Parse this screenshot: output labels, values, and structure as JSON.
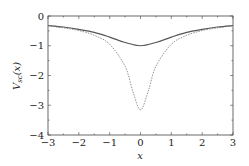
{
  "chart_data": {
    "type": "line",
    "title": "",
    "xlabel": "x",
    "ylabel": "V_sc(x)",
    "xlim": [
      -3,
      3
    ],
    "ylim": [
      -4,
      0
    ],
    "xticks": [
      -3,
      -2,
      -1,
      0,
      1,
      2,
      3
    ],
    "yticks": [
      0,
      -1,
      -2,
      -3,
      -4
    ],
    "grid": false,
    "legend": null,
    "series": [
      {
        "name": "solid",
        "style": "solid",
        "color": "#555555",
        "x": [
          -3,
          -2.5,
          -2,
          -1.5,
          -1,
          -0.5,
          0,
          0.5,
          1,
          1.5,
          2,
          2.5,
          3
        ],
        "y": [
          -0.32,
          -0.37,
          -0.45,
          -0.55,
          -0.71,
          -0.89,
          -1.0,
          -0.89,
          -0.71,
          -0.55,
          -0.45,
          -0.37,
          -0.32
        ]
      },
      {
        "name": "dashed",
        "style": "dashed",
        "color": "#777777",
        "x": [
          -3,
          -2.5,
          -2,
          -1.5,
          -1,
          -0.5,
          -0.25,
          0,
          0.25,
          0.5,
          1,
          1.5,
          2,
          2.5,
          3
        ],
        "y": [
          -0.33,
          -0.4,
          -0.49,
          -0.65,
          -0.95,
          -1.69,
          -2.53,
          -3.16,
          -2.53,
          -1.69,
          -0.95,
          -0.65,
          -0.49,
          -0.4,
          -0.33
        ]
      }
    ]
  }
}
